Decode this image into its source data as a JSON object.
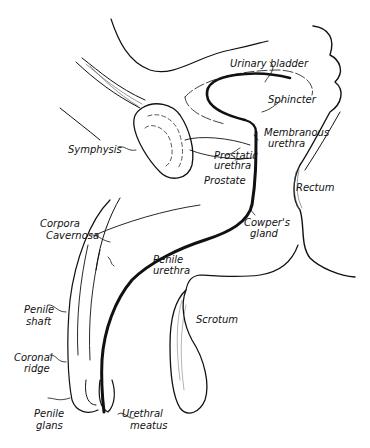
{
  "diagram": {
    "type": "anatomical-illustration",
    "colors": {
      "ink": "#111111",
      "background": "#ffffff"
    },
    "labels": {
      "urinary_bladder": "Urinary bladder",
      "sphincter": "Sphincter",
      "membranous_1": "Membranous",
      "membranous_2": "urethra",
      "symphysis": "Symphysis",
      "prostatic_1": "Prostatic",
      "prostatic_2": "urethra",
      "prostate": "Prostate",
      "rectum": "Rectum",
      "corpora_1": "Corpora",
      "corpora_2": "Cavernosa",
      "cowpers_1": "Cowper's",
      "cowpers_2": "gland",
      "penile_urethra_1": "Penile",
      "penile_urethra_2": "urethra",
      "scrotum": "Scrotum",
      "penile_shaft_1": "Penile",
      "penile_shaft_2": "shaft",
      "coronal_1": "Coronal",
      "coronal_2": "ridge",
      "glans_1": "Penile",
      "glans_2": "glans",
      "meatus_1": "Urethral",
      "meatus_2": "meatus"
    }
  }
}
